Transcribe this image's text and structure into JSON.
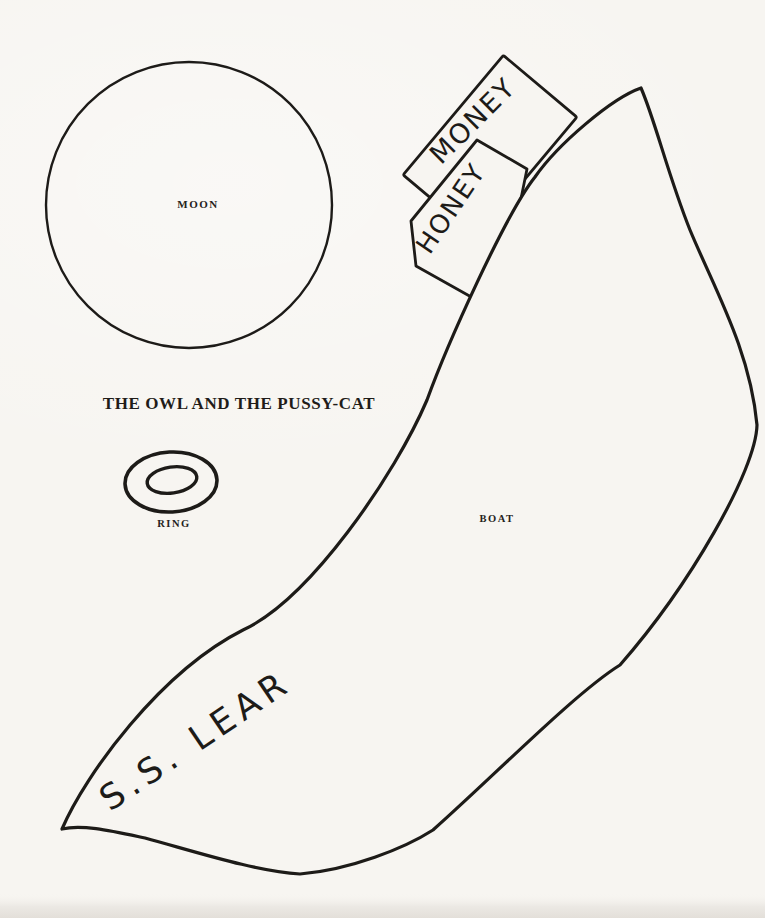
{
  "page": {
    "background_color": "#f7f5f1",
    "ink_color": "#1d1b18",
    "title": "THE OWL AND THE PUSSY-CAT"
  },
  "illustration": {
    "moon_label": "MOON",
    "ring_label": "RING",
    "boat_label": "BOAT",
    "boat_name": "S.S. LEAR",
    "money_jar_label": "MONEY",
    "honey_jar_label": "HONEY"
  }
}
